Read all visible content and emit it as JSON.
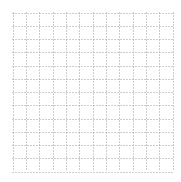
{
  "grid": {
    "columns": 12,
    "rows": 12,
    "line_color": "#9a9a9a",
    "line_style": "dotted",
    "background": "#ffffff"
  }
}
